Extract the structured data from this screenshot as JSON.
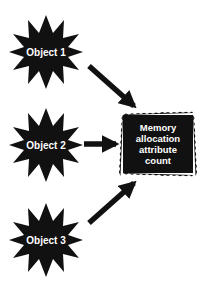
{
  "diagram": {
    "sources": [
      {
        "label": "Object 1",
        "cx": 46,
        "cy": 52
      },
      {
        "label": "Object 2",
        "cx": 46,
        "cy": 145
      },
      {
        "label": "Object 3",
        "cx": 46,
        "cy": 240
      }
    ],
    "target": {
      "lines": [
        "Memory",
        "allocation",
        "attribute",
        "count"
      ]
    },
    "edges": [
      {
        "from": "Object 1",
        "to": "Memory allocation attribute count"
      },
      {
        "from": "Object 2",
        "to": "Memory allocation attribute count"
      },
      {
        "from": "Object 3",
        "to": "Memory allocation attribute count"
      }
    ],
    "colors": {
      "shape_fill": "#111111",
      "text": "#ffffff",
      "background": "#ffffff"
    }
  }
}
